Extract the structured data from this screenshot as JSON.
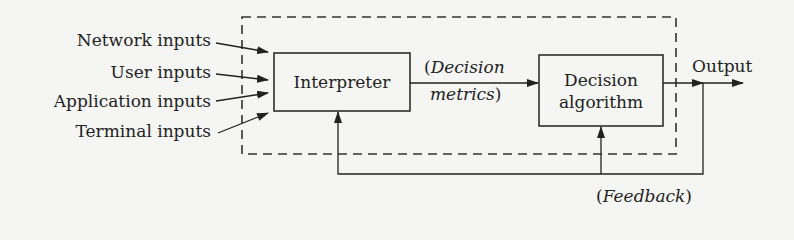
{
  "diagram": {
    "inputs": [
      {
        "label": "Network inputs"
      },
      {
        "label": "User inputs"
      },
      {
        "label": "Application inputs"
      },
      {
        "label": "Terminal inputs"
      }
    ],
    "interpreter": {
      "label": "Interpreter"
    },
    "decision_metrics": {
      "open": "(",
      "line1": "Decision",
      "line2": "metrics",
      "close": ")"
    },
    "decision_algorithm": {
      "line1": "Decision",
      "line2": "algorithm"
    },
    "output": {
      "label": "Output"
    },
    "feedback": {
      "open": "(",
      "label": "Feedback",
      "close": ")"
    },
    "colors": {
      "line": "#2a2a2a",
      "background": "#f5f5f3"
    }
  }
}
